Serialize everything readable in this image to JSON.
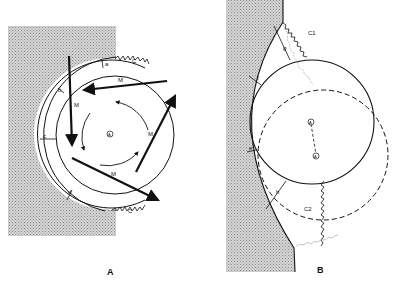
{
  "figure": {
    "panels": [
      {
        "id": "A",
        "label": "A",
        "segment_labels": [
          "a",
          "b",
          "c",
          "d"
        ],
        "arrow_label": "M",
        "spring_label": "C",
        "center_symbol": "A"
      },
      {
        "id": "B",
        "label": "B",
        "segment_labels": [
          "g",
          "f",
          "e",
          "h"
        ],
        "spring_labels": [
          "C1",
          "C2"
        ],
        "center_symbols": [
          "A",
          "A"
        ]
      }
    ]
  }
}
